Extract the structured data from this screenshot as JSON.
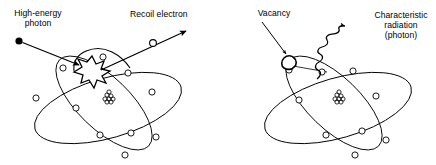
{
  "figure": {
    "background_color": "#ffffff",
    "stroke_color": "#000000",
    "text_color": "#000000",
    "width": 436,
    "height": 165
  },
  "panels": [
    {
      "id": "left-panel",
      "name": "compton-interaction-panel",
      "labels": {
        "photon": "High-energy\nphoton",
        "recoil": "Recoil electron"
      },
      "elements": {
        "incident_photon_marker": "filled-dot",
        "interaction_marker": "starburst",
        "ejected_electron_marker": "open-circle",
        "nucleus": "nucleon-cluster",
        "orbit_count": 2,
        "electron_count": 9
      }
    },
    {
      "id": "right-panel",
      "name": "characteristic-radiation-panel",
      "labels": {
        "vacancy": "Vacancy",
        "radiation": "Characteristic\nradiation\n(photon)"
      },
      "elements": {
        "vacancy_marker": "irregular-blob",
        "emitted_photon_marker": "wavy-arrow",
        "transition_line": "electron-drop-line",
        "nucleus": "nucleon-cluster",
        "orbit_count": 2,
        "electron_count": 9
      }
    }
  ]
}
